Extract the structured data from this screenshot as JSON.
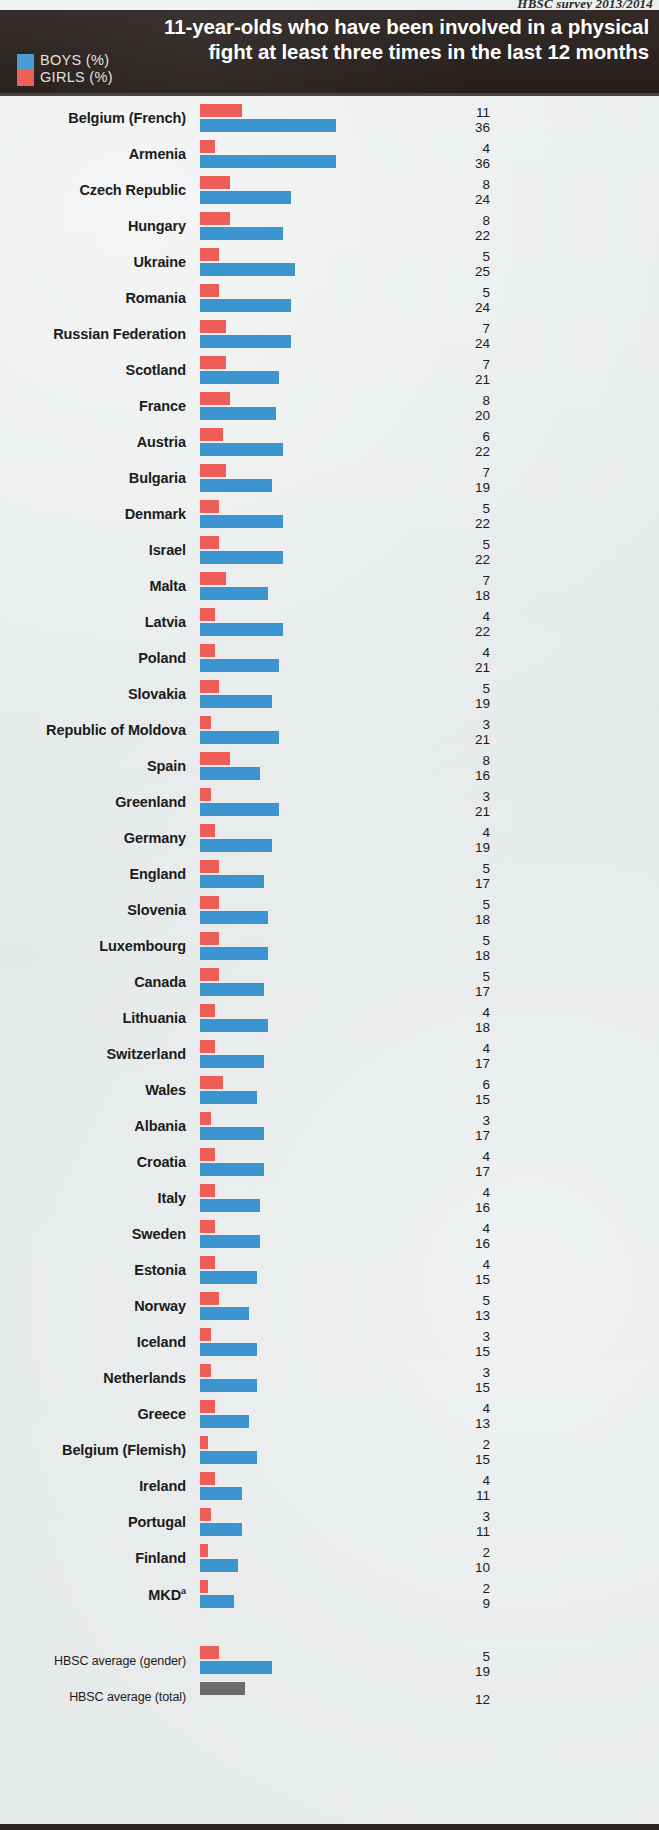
{
  "source_note": "HBSC survey 2013/2014",
  "header": {
    "title": "11-year-olds who have been involved in a physical fight at least three times in the last 12 months",
    "legend": [
      {
        "key": "boys",
        "label": "BOYS (%)",
        "color": "#3d95d0"
      },
      {
        "key": "girls",
        "label": "GIRLS (%)",
        "color": "#ee5d58"
      }
    ]
  },
  "footnote_marker": "a",
  "chart_data": {
    "type": "bar",
    "orientation": "horizontal",
    "title": "11-year-olds who have been involved in a physical fight at least three times in the last 12 months",
    "subtitle": "HBSC survey 2013/2014",
    "xlabel": "",
    "ylabel": "",
    "xlim": [
      0,
      36
    ],
    "grid": false,
    "legend_position": "top-left",
    "sort": "descending by boys value",
    "series": [
      {
        "name": "GIRLS (%)",
        "color": "#ee5d58"
      },
      {
        "name": "BOYS (%)",
        "color": "#3d95d0"
      }
    ],
    "categories": [
      "Belgium (French)",
      "Armenia",
      "Czech Republic",
      "Hungary",
      "Ukraine",
      "Romania",
      "Russian Federation",
      "Scotland",
      "France",
      "Austria",
      "Bulgaria",
      "Denmark",
      "Israel",
      "Malta",
      "Latvia",
      "Poland",
      "Slovakia",
      "Republic of Moldova",
      "Spain",
      "Greenland",
      "Germany",
      "England",
      "Slovenia",
      "Luxembourg",
      "Canada",
      "Lithuania",
      "Switzerland",
      "Wales",
      "Albania",
      "Croatia",
      "Italy",
      "Sweden",
      "Estonia",
      "Norway",
      "Iceland",
      "Netherlands",
      "Greece",
      "Belgium (Flemish)",
      "Ireland",
      "Portugal",
      "Finland",
      "MKD"
    ],
    "girls": [
      11,
      4,
      8,
      8,
      5,
      5,
      7,
      7,
      8,
      6,
      7,
      5,
      5,
      7,
      4,
      4,
      5,
      3,
      8,
      3,
      4,
      5,
      5,
      5,
      5,
      4,
      4,
      6,
      3,
      4,
      4,
      4,
      4,
      5,
      3,
      3,
      4,
      2,
      4,
      3,
      2,
      2
    ],
    "boys": [
      36,
      36,
      24,
      22,
      25,
      24,
      24,
      21,
      20,
      22,
      19,
      22,
      22,
      18,
      22,
      21,
      19,
      21,
      16,
      21,
      19,
      17,
      18,
      18,
      17,
      18,
      17,
      15,
      17,
      17,
      16,
      16,
      15,
      13,
      15,
      15,
      13,
      15,
      11,
      11,
      10,
      9
    ],
    "averages": [
      {
        "label": "HBSC average (gender)",
        "girls": 5,
        "boys": 19,
        "total": null
      },
      {
        "label": "HBSC average (total)",
        "girls": null,
        "boys": null,
        "total": 12
      }
    ]
  },
  "rows": [
    {
      "name": "Belgium (French)",
      "girls": 11,
      "boys": 36
    },
    {
      "name": "Armenia",
      "girls": 4,
      "boys": 36
    },
    {
      "name": "Czech Republic",
      "girls": 8,
      "boys": 24
    },
    {
      "name": "Hungary",
      "girls": 8,
      "boys": 22
    },
    {
      "name": "Ukraine",
      "girls": 5,
      "boys": 25
    },
    {
      "name": "Romania",
      "girls": 5,
      "boys": 24
    },
    {
      "name": "Russian Federation",
      "girls": 7,
      "boys": 24
    },
    {
      "name": "Scotland",
      "girls": 7,
      "boys": 21
    },
    {
      "name": "France",
      "girls": 8,
      "boys": 20
    },
    {
      "name": "Austria",
      "girls": 6,
      "boys": 22
    },
    {
      "name": "Bulgaria",
      "girls": 7,
      "boys": 19
    },
    {
      "name": "Denmark",
      "girls": 5,
      "boys": 22
    },
    {
      "name": "Israel",
      "girls": 5,
      "boys": 22
    },
    {
      "name": "Malta",
      "girls": 7,
      "boys": 18
    },
    {
      "name": "Latvia",
      "girls": 4,
      "boys": 22
    },
    {
      "name": "Poland",
      "girls": 4,
      "boys": 21
    },
    {
      "name": "Slovakia",
      "girls": 5,
      "boys": 19
    },
    {
      "name": "Republic of Moldova",
      "girls": 3,
      "boys": 21
    },
    {
      "name": "Spain",
      "girls": 8,
      "boys": 16
    },
    {
      "name": "Greenland",
      "girls": 3,
      "boys": 21
    },
    {
      "name": "Germany",
      "girls": 4,
      "boys": 19
    },
    {
      "name": "England",
      "girls": 5,
      "boys": 17
    },
    {
      "name": "Slovenia",
      "girls": 5,
      "boys": 18
    },
    {
      "name": "Luxembourg",
      "girls": 5,
      "boys": 18
    },
    {
      "name": "Canada",
      "girls": 5,
      "boys": 17
    },
    {
      "name": "Lithuania",
      "girls": 4,
      "boys": 18
    },
    {
      "name": "Switzerland",
      "girls": 4,
      "boys": 17
    },
    {
      "name": "Wales",
      "girls": 6,
      "boys": 15
    },
    {
      "name": "Albania",
      "girls": 3,
      "boys": 17
    },
    {
      "name": "Croatia",
      "girls": 4,
      "boys": 17
    },
    {
      "name": "Italy",
      "girls": 4,
      "boys": 16
    },
    {
      "name": "Sweden",
      "girls": 4,
      "boys": 16
    },
    {
      "name": "Estonia",
      "girls": 4,
      "boys": 15
    },
    {
      "name": "Norway",
      "girls": 5,
      "boys": 13
    },
    {
      "name": "Iceland",
      "girls": 3,
      "boys": 15
    },
    {
      "name": "Netherlands",
      "girls": 3,
      "boys": 15
    },
    {
      "name": "Greece",
      "girls": 4,
      "boys": 13
    },
    {
      "name": "Belgium (Flemish)",
      "girls": 2,
      "boys": 15
    },
    {
      "name": "Ireland",
      "girls": 4,
      "boys": 11
    },
    {
      "name": "Portugal",
      "girls": 3,
      "boys": 11
    },
    {
      "name": "Finland",
      "girls": 2,
      "boys": 10
    },
    {
      "name": "MKD",
      "girls": 2,
      "boys": 9,
      "footnote": "a"
    }
  ],
  "averages": [
    {
      "name": "HBSC average (gender)",
      "girls": 5,
      "boys": 19
    },
    {
      "name": "HBSC average (total)",
      "total": 12
    }
  ],
  "scale": {
    "px_per_unit": 3.78,
    "bar_origin_x": 200
  }
}
